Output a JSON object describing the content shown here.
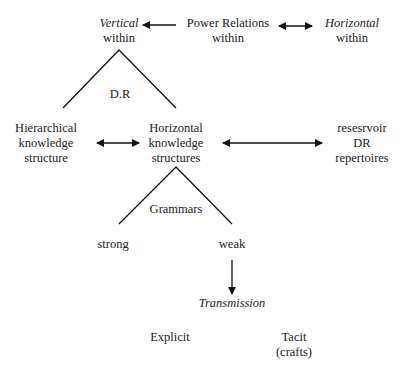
{
  "nodes": {
    "vertical": {
      "line1": "Vertical",
      "line2": "within"
    },
    "power_relations": {
      "line1": "Power Relations",
      "line2": "within"
    },
    "horizontal_top": {
      "line1": "Horizontal",
      "line2": "within"
    },
    "dr_label": "D.R",
    "hierarchical": {
      "line1": "Hierarchical",
      "line2": "knowledge",
      "line3": "structure"
    },
    "horizontal_ks": {
      "line1": "Horizontal",
      "line2": "knowledge",
      "line3": "structures"
    },
    "reservoir": {
      "line1": "resesrvoir",
      "line2": "DR",
      "line3": "repertoires"
    },
    "grammars_label": "Grammars",
    "strong": "strong",
    "weak": "weak",
    "transmission": "Transmission",
    "explicit": "Explicit",
    "tacit": {
      "line1": "Tacit",
      "line2": "(crafts)"
    }
  },
  "colors": {
    "line": "#111111",
    "text": "#1a1a1a",
    "background": "#ffffff"
  }
}
